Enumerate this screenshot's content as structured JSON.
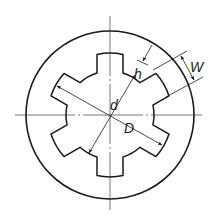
{
  "diagram": {
    "colors": {
      "stroke": "#1a1a1a",
      "centerline": "#555555",
      "background": "#ffffff"
    },
    "geometry": {
      "center": [
        110,
        115
      ],
      "outer_radius": 84,
      "tooth_tip_radius": 62,
      "root_radius": 44,
      "tooth_count": 6,
      "tooth_half_width": 13,
      "first_tooth_angle_deg": 90
    },
    "labels": {
      "h": "h",
      "W": "W",
      "d": "d",
      "D": "D"
    },
    "dimensions": [
      {
        "name": "h",
        "meaning": "tooth height"
      },
      {
        "name": "W",
        "meaning": "tooth width"
      },
      {
        "name": "d",
        "meaning": "minor (root) diameter"
      },
      {
        "name": "D",
        "meaning": "major diameter"
      }
    ]
  }
}
